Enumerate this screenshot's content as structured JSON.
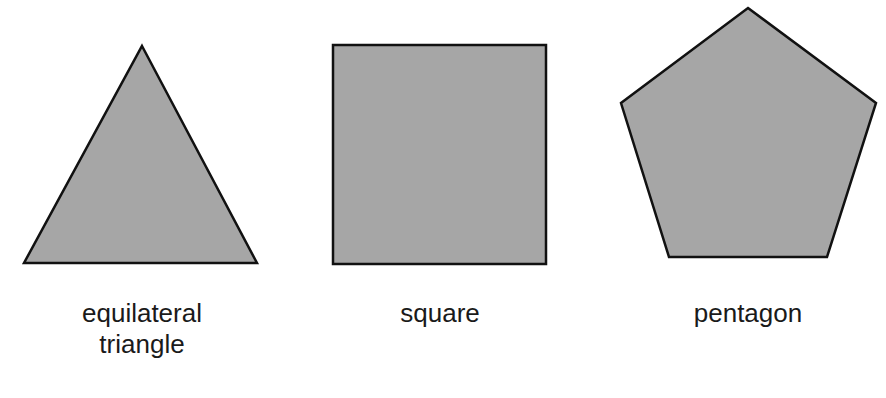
{
  "figure": {
    "fill_color": "#a6a6a6",
    "stroke_color": "#111111",
    "shapes": [
      {
        "name": "equilateral triangle",
        "label_line1": "equilateral",
        "label_line2": "triangle",
        "points": "142,46 257,263 24,263"
      },
      {
        "name": "square",
        "label_line1": "square",
        "label_line2": "",
        "points": "333,45 546,45 546,264 333,264"
      },
      {
        "name": "pentagon",
        "label_line1": "pentagon",
        "label_line2": "",
        "points": "748,8 876,103 827,257 669,257 621,103"
      }
    ]
  }
}
